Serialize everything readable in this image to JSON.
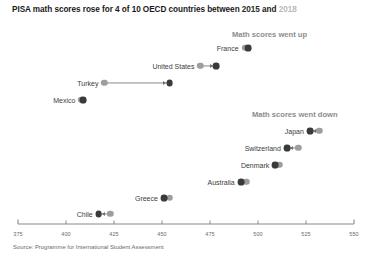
{
  "title": {
    "main": "PISA math scores rose for 4 of 10 OECD countries between ",
    "year_start": "2015",
    "conjunction": " and ",
    "year_end": "2018"
  },
  "groups": {
    "up_label": "Math scores went up",
    "down_label": "Math scores went down"
  },
  "source": "Source: Programme for International Student Assessment",
  "colors": {
    "dot_2018": "#3a3a3a",
    "dot_2015": "#9e9e9e",
    "connector": "#8a8a8a",
    "group_header": "#8d8d8d",
    "axis": "#8a8a8a",
    "title_muted": "#b9b9b9"
  },
  "chart_data": {
    "type": "scatter",
    "title": "PISA math scores rose for 4 of 10 OECD countries between 2015 and 2018",
    "xlabel": "",
    "ylabel": "",
    "xlim": [
      375,
      550
    ],
    "grid": false,
    "legend": [
      "2015",
      "2018"
    ],
    "legend_position": "none",
    "axis_ticks": [
      375,
      400,
      425,
      450,
      475,
      500,
      525,
      550
    ],
    "axis_tick_labels": [
      "375",
      "400",
      "425",
      "450",
      "475",
      "500",
      "525",
      "550"
    ],
    "series": [
      {
        "name": "2015",
        "values": [
          493,
          470,
          420,
          408,
          532,
          521,
          511,
          494,
          454,
          423
        ]
      },
      {
        "name": "2018",
        "values": [
          495,
          478,
          454,
          409,
          527,
          515,
          509,
          491,
          451,
          417
        ]
      }
    ],
    "categories": [
      "France",
      "United States",
      "Turkey",
      "Mexico",
      "Japan",
      "Switzerland",
      "Denmark",
      "Australia",
      "Greece",
      "Chile"
    ],
    "points": [
      {
        "country": "France",
        "group": "up",
        "v2015": 493,
        "v2018": 495,
        "direction": "right"
      },
      {
        "country": "United States",
        "group": "up",
        "v2015": 470,
        "v2018": 478,
        "direction": "right"
      },
      {
        "country": "Turkey",
        "group": "up",
        "v2015": 420,
        "v2018": 454,
        "direction": "right"
      },
      {
        "country": "Mexico",
        "group": "up",
        "v2015": 408,
        "v2018": 409,
        "direction": "right"
      },
      {
        "country": "Japan",
        "group": "down",
        "v2015": 532,
        "v2018": 527,
        "direction": "left"
      },
      {
        "country": "Switzerland",
        "group": "down",
        "v2015": 521,
        "v2018": 515,
        "direction": "left"
      },
      {
        "country": "Denmark",
        "group": "down",
        "v2015": 511,
        "v2018": 509,
        "direction": "left"
      },
      {
        "country": "Australia",
        "group": "down",
        "v2015": 494,
        "v2018": 491,
        "direction": "left"
      },
      {
        "country": "Greece",
        "group": "down",
        "v2015": 454,
        "v2018": 451,
        "direction": "left"
      },
      {
        "country": "Chile",
        "group": "down",
        "v2015": 423,
        "v2018": 417,
        "direction": "left"
      }
    ]
  },
  "layout": {
    "row_tops": [
      41,
      59,
      76,
      93,
      124,
      141,
      158,
      175,
      191,
      207
    ],
    "axis_y": 224,
    "axis_x0_px": 18,
    "axis_x1_px": 354
  }
}
